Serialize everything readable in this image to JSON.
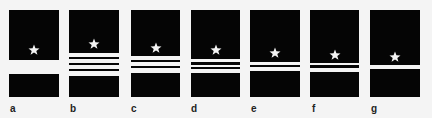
{
  "colors": {
    "panel": "#050505",
    "stripe": "#f4f4f4",
    "background": "#f4f4f4"
  },
  "panels": [
    {
      "label": "a",
      "x": 9,
      "w": 50,
      "star_y": 40,
      "stripes": [
        [
          50,
          14
        ]
      ]
    },
    {
      "label": "b",
      "x": 69,
      "w": 50,
      "star_y": 34,
      "stripes": [
        [
          43,
          4
        ],
        [
          49,
          4
        ],
        [
          55,
          4
        ],
        [
          61,
          5
        ]
      ]
    },
    {
      "label": "c",
      "x": 131,
      "w": 49,
      "star_y": 38,
      "stripes": [
        [
          46,
          4
        ],
        [
          52,
          4
        ],
        [
          58,
          5
        ]
      ]
    },
    {
      "label": "d",
      "x": 191,
      "w": 49,
      "star_y": 40,
      "stripes": [
        [
          49,
          3
        ],
        [
          55,
          2
        ],
        [
          59,
          4
        ]
      ]
    },
    {
      "label": "e",
      "x": 250,
      "w": 50,
      "star_y": 43,
      "stripes": [
        [
          52,
          3
        ],
        [
          57,
          4
        ]
      ]
    },
    {
      "label": "f",
      "x": 310,
      "w": 49,
      "star_y": 45,
      "stripes": [
        [
          53,
          2
        ],
        [
          58,
          4
        ]
      ]
    },
    {
      "label": "g",
      "x": 370,
      "w": 50,
      "star_y": 47,
      "stripes": [
        [
          55,
          4
        ]
      ]
    }
  ]
}
